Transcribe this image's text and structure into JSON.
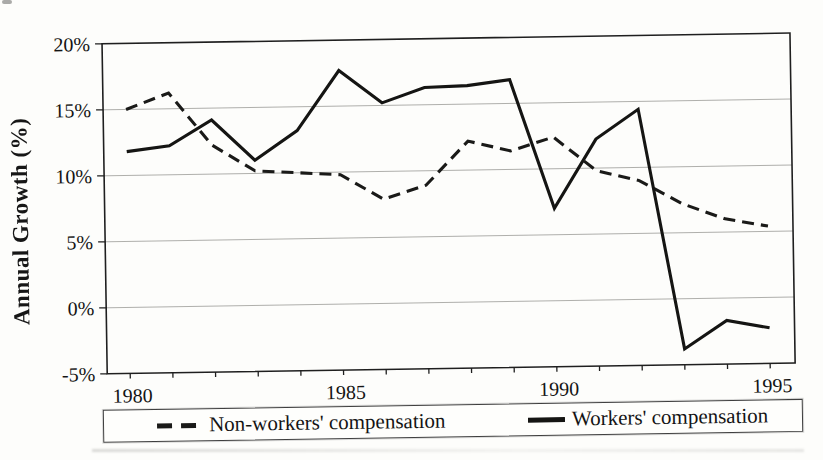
{
  "chart_data": {
    "type": "line",
    "ylabel": "Annual Growth (%)",
    "xlabel": "",
    "x": [
      1980,
      1981,
      1982,
      1983,
      1984,
      1985,
      1986,
      1987,
      1988,
      1989,
      1990,
      1991,
      1992,
      1993,
      1994,
      1995
    ],
    "x_tick_labels": [
      "1980",
      "1985",
      "1990",
      "1995"
    ],
    "ylim": [
      -5,
      20
    ],
    "y_ticks": [
      20,
      15,
      10,
      5,
      0,
      -5
    ],
    "y_tick_labels": [
      "20%",
      "15%",
      "10%",
      "5%",
      "0%",
      "-5%"
    ],
    "grid": "horizontal",
    "legend_position": "bottom",
    "line_color": "#1a1a18",
    "series": [
      {
        "name": "Non-workers' compensation",
        "style": "dashed",
        "color": "#1a1a18",
        "values": [
          15.0,
          16.2,
          12.2,
          10.2,
          10.0,
          9.8,
          7.9,
          8.9,
          12.2,
          11.4,
          12.4,
          9.8,
          9.0,
          7.2,
          6.0,
          5.4
        ]
      },
      {
        "name": "Workers' compensation",
        "style": "solid",
        "color": "#151513",
        "values": [
          11.8,
          12.2,
          14.1,
          11.0,
          13.2,
          17.7,
          15.2,
          16.3,
          16.4,
          16.8,
          7.0,
          12.2,
          14.4,
          -3.8,
          -1.7,
          -2.3
        ]
      }
    ]
  }
}
